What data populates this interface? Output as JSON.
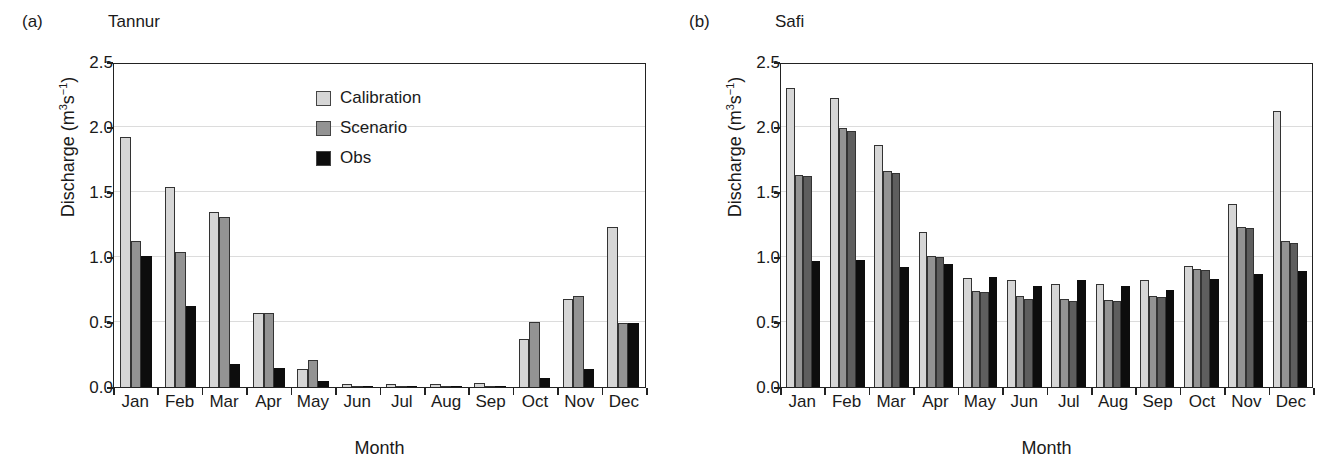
{
  "figure": {
    "width": 1334,
    "height": 473,
    "background": "#ffffff"
  },
  "colors": {
    "calibration": "#d6d6d6",
    "scenario": "#939393",
    "scenario_dp": "#5e5e5e",
    "obs": "#0d0d0d",
    "axis": "#222222",
    "gridline": "#dcdcdc"
  },
  "panels": [
    {
      "id": "a",
      "panel_label": "(a)",
      "title": "Tannur"
    },
    {
      "id": "b",
      "panel_label": "(b)",
      "title": "Safi"
    }
  ],
  "axis": {
    "ylabel_text": "Discharge (m",
    "ylabel_sup1": "3",
    "ylabel_mid": "s",
    "ylabel_sup2": "−1",
    "ylabel_close": ")",
    "ylabel_full": "Discharge (m3s-1)",
    "xlabel": "Month",
    "yticks": [
      "2.5",
      "2.0",
      "1.5",
      "1.0",
      "0.5",
      "0.0"
    ],
    "ylim": [
      0,
      2.5
    ]
  },
  "legend_a": {
    "items": [
      {
        "label": "Calibration",
        "color": "#d6d6d6",
        "key": "calibration"
      },
      {
        "label": "Scenario",
        "color": "#939393",
        "key": "scenario"
      },
      {
        "label": "Obs",
        "color": "#0d0d0d",
        "key": "obs"
      }
    ]
  },
  "legend_b": {
    "items": [
      {
        "label": "Calibration",
        "color": "#d6d6d6",
        "key": "calibration"
      },
      {
        "label": "Scenario",
        "color": "#939393",
        "key": "scenario"
      },
      {
        "label": "Scenario - ΔP",
        "color": "#5e5e5e",
        "key": "scenario_dp"
      },
      {
        "label": "Obs",
        "color": "#0d0d0d",
        "key": "obs"
      }
    ]
  },
  "chart_data": [
    {
      "type": "bar",
      "title": "Tannur",
      "panel_label": "(a)",
      "xlabel": "Month",
      "ylabel": "Discharge (m3 s-1)",
      "ylim": [
        0,
        2.5
      ],
      "ytick_values": [
        0.0,
        0.5,
        1.0,
        1.5,
        2.0,
        2.5
      ],
      "grid": "horizontal",
      "legend_position": "upper-right-inside",
      "categories": [
        "Jan",
        "Feb",
        "Mar",
        "Apr",
        "May",
        "Jun",
        "Jul",
        "Aug",
        "Sep",
        "Oct",
        "Nov",
        "Dec"
      ],
      "series": [
        {
          "name": "Calibration",
          "color": "#d6d6d6",
          "values": [
            1.92,
            1.54,
            1.35,
            0.57,
            0.14,
            0.02,
            0.02,
            0.02,
            0.03,
            0.37,
            0.68,
            1.23
          ]
        },
        {
          "name": "Scenario",
          "color": "#939393",
          "values": [
            1.12,
            1.04,
            1.31,
            0.57,
            0.21,
            0.01,
            0.01,
            0.01,
            0.01,
            0.5,
            0.7,
            0.49
          ]
        },
        {
          "name": "Obs",
          "color": "#0d0d0d",
          "values": [
            1.01,
            0.62,
            0.18,
            0.15,
            0.05,
            0.0,
            0.0,
            0.0,
            0.0,
            0.07,
            0.14,
            0.49
          ]
        }
      ]
    },
    {
      "type": "bar",
      "title": "Safi",
      "panel_label": "(b)",
      "xlabel": "Month",
      "ylabel": "Discharge (m3 s-1)",
      "ylim": [
        0,
        2.5
      ],
      "ytick_values": [
        0.0,
        0.5,
        1.0,
        1.5,
        2.0,
        2.5
      ],
      "grid": "horizontal",
      "legend_position": "upper-right-inside",
      "categories": [
        "Jan",
        "Feb",
        "Mar",
        "Apr",
        "May",
        "Jun",
        "Jul",
        "Aug",
        "Sep",
        "Oct",
        "Nov",
        "Dec"
      ],
      "series": [
        {
          "name": "Calibration",
          "color": "#d6d6d6",
          "values": [
            2.3,
            2.22,
            1.86,
            1.19,
            0.84,
            0.82,
            0.79,
            0.79,
            0.82,
            0.93,
            1.41,
            2.12
          ]
        },
        {
          "name": "Scenario",
          "color": "#939393",
          "values": [
            1.63,
            1.99,
            1.66,
            1.01,
            0.74,
            0.7,
            0.68,
            0.67,
            0.7,
            0.91,
            1.23,
            1.12
          ]
        },
        {
          "name": "Scenario - ΔP",
          "color": "#5e5e5e",
          "values": [
            1.62,
            1.97,
            1.65,
            1.0,
            0.73,
            0.68,
            0.66,
            0.66,
            0.69,
            0.9,
            1.22,
            1.11
          ]
        },
        {
          "name": "Obs",
          "color": "#0d0d0d",
          "values": [
            0.97,
            0.98,
            0.92,
            0.95,
            0.85,
            0.78,
            0.82,
            0.78,
            0.75,
            0.83,
            0.87,
            0.89
          ]
        }
      ]
    }
  ]
}
